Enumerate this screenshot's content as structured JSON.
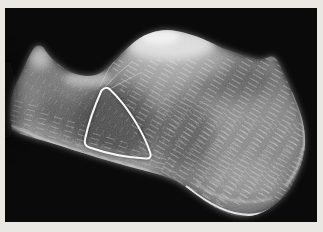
{
  "figure": {
    "kind": "radiograph",
    "annotation_label": "neutral-triangle-outline"
  },
  "colors": {
    "page_background": "#e9e8e3",
    "film_black": "#0a0a0a",
    "bone_core": "#9a9a9a",
    "bone_mid": "#6f6f6f",
    "bone_edge": "#474747",
    "dome_highlight": "#e3e3e3",
    "cortex_line": "#d2d2d2",
    "annotation_stroke": "#f7f7f7"
  }
}
